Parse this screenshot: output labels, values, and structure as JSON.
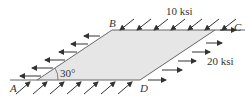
{
  "diagram": {
    "type": "stress-element",
    "shape": "parallelogram",
    "fill_color": "#e6e6e6",
    "edge_color": "#555555",
    "vertices": {
      "A": {
        "label": "A",
        "x": 37,
        "y": 80
      },
      "B": {
        "label": "B",
        "x": 112,
        "y": 30
      },
      "C": {
        "label": "C",
        "x": 215,
        "y": 30
      },
      "D": {
        "label": "D",
        "x": 140,
        "y": 80
      }
    },
    "angle_label": "30°",
    "stresses": {
      "normal_label": "20 ksi",
      "shear_label": "10 ksi"
    }
  }
}
